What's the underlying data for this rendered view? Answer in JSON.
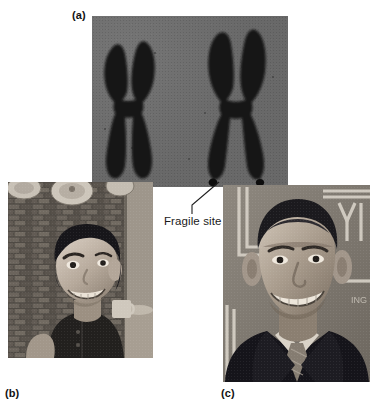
{
  "figure": {
    "width": 381,
    "height": 411,
    "background_color": "#ffffff"
  },
  "panels": [
    {
      "id": "a",
      "label": "(a)",
      "kind": "micrograph",
      "description": "Two stained X chromosomes on a gray micrograph background; the right-hand chromosome shows a fragile site constriction near the tip of each long arm.",
      "background_color": "#6e6e6e",
      "chromosome_color": "#121212",
      "chromosomes": [
        {
          "name": "normal-x-chromosome",
          "fragile_site": false
        },
        {
          "name": "fragile-x-chromosome",
          "fragile_site": true
        }
      ]
    },
    {
      "id": "b",
      "label": "(b)",
      "kind": "photograph",
      "description": "Black-and-white photograph of a young boy smiling in front of a brick wall."
    },
    {
      "id": "c",
      "label": "(c)",
      "kind": "photograph",
      "description": "Black-and-white photograph of a smiling young man wearing a suit and tie in front of a banner."
    }
  ],
  "annotations": [
    {
      "name": "fragile-site-callout",
      "text": "Fragile site",
      "points_to": "fragile-x-chromosome",
      "color": "#1a1a1a"
    }
  ]
}
